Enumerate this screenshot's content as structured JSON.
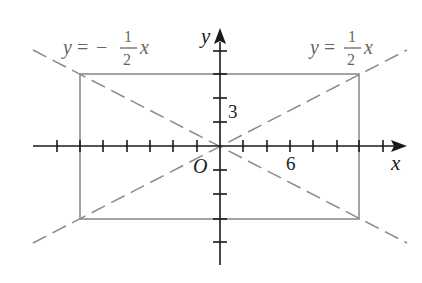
{
  "figure": {
    "type": "coordinate-diagram",
    "axes": {
      "x_label": "x",
      "y_label": "y",
      "origin_label": "O",
      "x_tick_label": "6",
      "y_tick_label": "3",
      "x_tick_range": [
        -7,
        7
      ],
      "y_tick_range": [
        -4,
        4
      ]
    },
    "rectangle": {
      "x_min": -6,
      "x_max": 6,
      "y_min": -3,
      "y_max": 3,
      "color": "#888888"
    },
    "lines": [
      {
        "label_lhs": "y",
        "label_eq": "=",
        "label_sign": "",
        "label_num": "1",
        "label_den": "2",
        "label_var": "x",
        "slope": 0.5,
        "style": "dashed",
        "color": "#8a8a8a"
      },
      {
        "label_lhs": "y",
        "label_eq": "=",
        "label_sign": "−",
        "label_num": "1",
        "label_den": "2",
        "label_var": "x",
        "slope": -0.5,
        "style": "dashed",
        "color": "#8a8a8a"
      }
    ],
    "colors": {
      "axis": "#1a1a1a",
      "label_gray": "#666666"
    }
  }
}
